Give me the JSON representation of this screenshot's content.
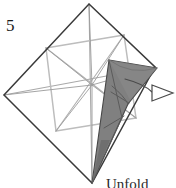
{
  "figure": {
    "step_label": "5",
    "caption": "Unfold",
    "colors": {
      "outline": "#3a3a3a",
      "crease_light": "#b3b3b3",
      "crease_mid": "#8f8f8f",
      "flap_fill": "#808080",
      "flap_outline": "#4a4a4a",
      "arrow_outline": "#4a4a4a",
      "background": "#ffffff",
      "text": "#1a1a1a"
    },
    "outer_square": {
      "name": "paper-outline-diamond",
      "points": [
        [
          89,
          4
        ],
        [
          155,
          67
        ],
        [
          92,
          183
        ],
        [
          4,
          95
        ]
      ]
    },
    "creases": [
      {
        "name": "crease-horizontal-midline",
        "from": [
          4,
          95
        ],
        "to": [
          155,
          67
        ]
      },
      {
        "name": "crease-vertical-midline",
        "from": [
          89,
          4
        ],
        "to": [
          92,
          183
        ]
      },
      {
        "name": "crease-inner-square-top",
        "from": [
          46,
          48
        ],
        "to": [
          124,
          35
        ]
      },
      {
        "name": "crease-inner-square-right",
        "from": [
          124,
          35
        ],
        "to": [
          136,
          118
        ]
      },
      {
        "name": "crease-inner-square-bottom",
        "from": [
          136,
          118
        ],
        "to": [
          56,
          131
        ]
      },
      {
        "name": "crease-inner-square-left",
        "from": [
          56,
          131
        ],
        "to": [
          46,
          48
        ]
      },
      {
        "name": "crease-diagonal-nw-se",
        "from": [
          46,
          48
        ],
        "to": [
          136,
          118
        ]
      },
      {
        "name": "crease-diagonal-ne-sw",
        "from": [
          124,
          35
        ],
        "to": [
          56,
          131
        ]
      },
      {
        "name": "crease-spoke-center-to-top",
        "from": [
          92,
          85
        ],
        "to": [
          89,
          4
        ]
      },
      {
        "name": "crease-spoke-center-to-bottom",
        "from": [
          92,
          85
        ],
        "to": [
          92,
          183
        ]
      }
    ],
    "flap": {
      "name": "shaded-flap-cone",
      "outline": [
        [
          92,
          183
        ],
        [
          113,
          62
        ],
        [
          155,
          67
        ],
        [
          130,
          100
        ]
      ],
      "inner_folds": [
        {
          "from": [
            113,
            62
          ],
          "to": [
            130,
            100
          ]
        },
        {
          "from": [
            155,
            67
          ],
          "to": [
            120,
            112
          ]
        },
        {
          "from": [
            92,
            183
          ],
          "to": [
            120,
            112
          ]
        },
        {
          "from": [
            113,
            62
          ],
          "to": [
            118,
            130
          ]
        },
        {
          "from": [
            105,
            138
          ],
          "to": [
            130,
            124
          ]
        }
      ]
    },
    "arrow": {
      "name": "unfold-arrow",
      "tail": [
        [
          128,
          82
        ],
        [
          148,
          92
        ],
        [
          160,
          92
        ]
      ],
      "head": [
        [
          158,
          85
        ],
        [
          174,
          93
        ],
        [
          158,
          101
        ]
      ]
    }
  }
}
